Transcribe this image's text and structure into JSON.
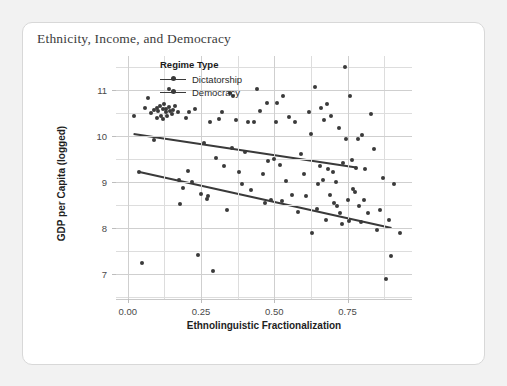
{
  "card": {
    "title": "Ethnicity, Income, and Democracy"
  },
  "legend": {
    "title": "Regime Type",
    "items": [
      {
        "label": "Dictatorship",
        "color": "#3a3a3a"
      },
      {
        "label": "Democracy",
        "color": "#3a3a3a"
      }
    ]
  },
  "chart_data": {
    "type": "scatter",
    "title": "Ethnicity, Income, and Democracy",
    "xlabel": "Ethnolinguistic Fractionalization",
    "ylabel": "GDP per Capita (logged)",
    "xlim": [
      -0.04,
      0.97
    ],
    "ylim": [
      6.45,
      11.75
    ],
    "xticks": [
      0.0,
      0.25,
      0.5,
      0.75
    ],
    "xticklabels": [
      "0.00",
      "0.25",
      "0.50",
      "0.75"
    ],
    "yticks": [
      7,
      8,
      9,
      10,
      11
    ],
    "yticklabels": [
      "7",
      "8",
      "9",
      "10",
      "11"
    ],
    "xminorticks": [
      0.125,
      0.375,
      0.625,
      0.875
    ],
    "yminorticks": [
      6.5,
      7.5,
      8.5,
      9.5,
      10.5,
      11.5
    ],
    "grid": true,
    "legend_position": "top-center-inside",
    "marker_color": "#3a3a3a",
    "line_color": "#3a3a3a",
    "points": [
      [
        0.02,
        10.45
      ],
      [
        0.04,
        9.22
      ],
      [
        0.05,
        7.24
      ],
      [
        0.06,
        10.62
      ],
      [
        0.07,
        10.83
      ],
      [
        0.08,
        10.5
      ],
      [
        0.09,
        10.58
      ],
      [
        0.09,
        9.92
      ],
      [
        0.1,
        10.62
      ],
      [
        0.1,
        10.4
      ],
      [
        0.105,
        10.55
      ],
      [
        0.11,
        10.67
      ],
      [
        0.115,
        10.45
      ],
      [
        0.12,
        10.59
      ],
      [
        0.12,
        10.38
      ],
      [
        0.125,
        10.7
      ],
      [
        0.13,
        10.52
      ],
      [
        0.13,
        10.6
      ],
      [
        0.135,
        10.44
      ],
      [
        0.14,
        10.63
      ],
      [
        0.14,
        11.03
      ],
      [
        0.145,
        10.55
      ],
      [
        0.15,
        10.48
      ],
      [
        0.155,
        10.58
      ],
      [
        0.16,
        10.66
      ],
      [
        0.17,
        10.52
      ],
      [
        0.175,
        9.05
      ],
      [
        0.18,
        8.52
      ],
      [
        0.19,
        8.88
      ],
      [
        0.2,
        10.4
      ],
      [
        0.205,
        9.24
      ],
      [
        0.21,
        10.52
      ],
      [
        0.22,
        9.0
      ],
      [
        0.23,
        10.6
      ],
      [
        0.24,
        7.42
      ],
      [
        0.25,
        8.74
      ],
      [
        0.26,
        9.85
      ],
      [
        0.27,
        8.63
      ],
      [
        0.275,
        8.7
      ],
      [
        0.28,
        10.3
      ],
      [
        0.29,
        7.05
      ],
      [
        0.3,
        9.52
      ],
      [
        0.31,
        10.38
      ],
      [
        0.32,
        10.52
      ],
      [
        0.33,
        9.35
      ],
      [
        0.34,
        8.4
      ],
      [
        0.35,
        10.95
      ],
      [
        0.355,
        9.75
      ],
      [
        0.36,
        10.88
      ],
      [
        0.37,
        10.35
      ],
      [
        0.38,
        9.22
      ],
      [
        0.39,
        8.95
      ],
      [
        0.4,
        9.65
      ],
      [
        0.41,
        10.32
      ],
      [
        0.42,
        8.82
      ],
      [
        0.43,
        10.32
      ],
      [
        0.44,
        11.04
      ],
      [
        0.45,
        10.55
      ],
      [
        0.46,
        9.18
      ],
      [
        0.47,
        8.55
      ],
      [
        0.475,
        10.72
      ],
      [
        0.48,
        9.45
      ],
      [
        0.49,
        8.62
      ],
      [
        0.5,
        9.5
      ],
      [
        0.505,
        10.3
      ],
      [
        0.51,
        10.72
      ],
      [
        0.52,
        9.38
      ],
      [
        0.525,
        8.58
      ],
      [
        0.53,
        10.88
      ],
      [
        0.54,
        9.02
      ],
      [
        0.55,
        10.42
      ],
      [
        0.56,
        8.72
      ],
      [
        0.57,
        10.3
      ],
      [
        0.58,
        8.35
      ],
      [
        0.59,
        9.62
      ],
      [
        0.6,
        9.18
      ],
      [
        0.61,
        8.7
      ],
      [
        0.62,
        10.52
      ],
      [
        0.625,
        10.05
      ],
      [
        0.63,
        7.9
      ],
      [
        0.64,
        11.08
      ],
      [
        0.645,
        8.42
      ],
      [
        0.65,
        8.95
      ],
      [
        0.655,
        9.35
      ],
      [
        0.66,
        10.62
      ],
      [
        0.665,
        9.05
      ],
      [
        0.67,
        10.35
      ],
      [
        0.675,
        8.18
      ],
      [
        0.68,
        10.7
      ],
      [
        0.685,
        9.28
      ],
      [
        0.69,
        8.72
      ],
      [
        0.695,
        10.45
      ],
      [
        0.7,
        9.22
      ],
      [
        0.705,
        8.55
      ],
      [
        0.71,
        9.0
      ],
      [
        0.715,
        8.48
      ],
      [
        0.72,
        10.18
      ],
      [
        0.725,
        8.32
      ],
      [
        0.73,
        8.08
      ],
      [
        0.735,
        9.42
      ],
      [
        0.74,
        11.52
      ],
      [
        0.745,
        9.95
      ],
      [
        0.75,
        8.62
      ],
      [
        0.755,
        8.15
      ],
      [
        0.76,
        10.88
      ],
      [
        0.765,
        9.48
      ],
      [
        0.77,
        8.85
      ],
      [
        0.775,
        8.78
      ],
      [
        0.78,
        9.3
      ],
      [
        0.785,
        9.95
      ],
      [
        0.79,
        8.48
      ],
      [
        0.795,
        8.12
      ],
      [
        0.8,
        10.02
      ],
      [
        0.805,
        8.6
      ],
      [
        0.81,
        9.28
      ],
      [
        0.82,
        8.32
      ],
      [
        0.83,
        10.48
      ],
      [
        0.84,
        9.72
      ],
      [
        0.85,
        7.95
      ],
      [
        0.86,
        8.4
      ],
      [
        0.87,
        9.1
      ],
      [
        0.88,
        6.88
      ],
      [
        0.89,
        8.18
      ],
      [
        0.9,
        7.38
      ],
      [
        0.91,
        8.95
      ],
      [
        0.93,
        7.88
      ]
    ],
    "fit_lines": [
      {
        "name": "Dictatorship",
        "x0": 0.02,
        "y0": 10.05,
        "x1": 0.78,
        "y1": 9.32
      },
      {
        "name": "Democracy",
        "x0": 0.04,
        "y0": 9.22,
        "x1": 0.9,
        "y1": 8.0
      }
    ]
  }
}
